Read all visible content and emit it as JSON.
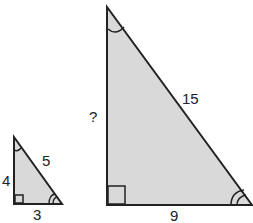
{
  "small_triangle": {
    "side_vertical": "4",
    "side_horizontal": "3",
    "hypotenuse": "5"
  },
  "large_triangle": {
    "side_vertical": "?",
    "side_horizontal": "9",
    "hypotenuse": "15"
  },
  "colors": {
    "fill": "#d9d9d9",
    "stroke": "#222222"
  }
}
